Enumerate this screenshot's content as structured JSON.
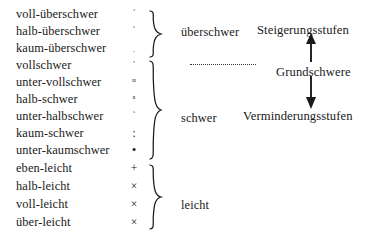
{
  "figure": {
    "rows": [
      {
        "term": "voll-überschwer",
        "symbol": "´",
        "symbol_name": "acute-accent-mark"
      },
      {
        "term": "halb-überschwer",
        "symbol": "`",
        "symbol_name": "grave-accent-mark"
      },
      {
        "term": "kaum-überschwer",
        "symbol": "ˌ",
        "symbol_name": "low-tick-mark"
      },
      {
        "term": "vollschwer",
        "symbol": "ʹ",
        "symbol_name": "prime-mark"
      },
      {
        "term": "unter-vollschwer",
        "symbol": "ᵚ",
        "symbol_name": "small-m-mark"
      },
      {
        "term": "halb-schwer",
        "symbol": "ⁿ",
        "symbol_name": "small-n-mark"
      },
      {
        "term": "unter-halbschwer",
        "symbol": "ˋ",
        "symbol_name": "small-grave-mark"
      },
      {
        "term": "kaum-schwer",
        "symbol": ":",
        "symbol_name": "colon-mark"
      },
      {
        "term": "unter-kaumschwer",
        "symbol": "•",
        "symbol_name": "bullet-mark"
      },
      {
        "term": "eben-leicht",
        "symbol": "+",
        "symbol_name": "plus-mark"
      },
      {
        "term": "halb-leicht",
        "symbol": "×",
        "symbol_name": "times-mark"
      },
      {
        "term": "voll-leicht",
        "symbol": "×",
        "symbol_name": "times-mark"
      },
      {
        "term": "über-leicht",
        "symbol": "×",
        "symbol_name": "times-mark"
      }
    ],
    "groups": [
      {
        "label": "überschwer"
      },
      {
        "label": "schwer"
      },
      {
        "label": "leicht"
      }
    ],
    "annotations": {
      "top": "Steigerungsstufen",
      "middle": "Grundschwere",
      "bottom": "Verminderungsstufen"
    }
  }
}
